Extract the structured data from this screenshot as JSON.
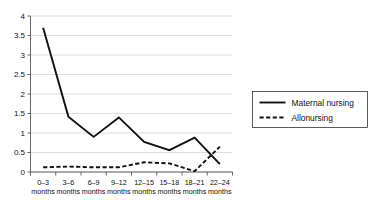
{
  "chart_data": {
    "type": "line",
    "title": "",
    "xlabel": "",
    "ylabel": "",
    "ylim": [
      0,
      4
    ],
    "ytick_values": [
      0,
      0.5,
      1,
      1.5,
      2,
      2.5,
      3,
      3.5,
      4
    ],
    "ytick_labels": [
      "0",
      "0.5",
      "1",
      "1.5",
      "2",
      "2.5",
      "3",
      "3.5",
      "4"
    ],
    "grid": true,
    "legend_position": "right",
    "categories": [
      "0–3 months",
      "3–6 months",
      "6–9 months",
      "9–12 months",
      "12–15 months",
      "15–18 months",
      "18–21 months",
      "22–24 months"
    ],
    "xtick_lines": [
      [
        "0–3",
        "months"
      ],
      [
        "3–6",
        "months"
      ],
      [
        "6–9",
        "months"
      ],
      [
        "9–12",
        "months"
      ],
      [
        "12–15",
        "months"
      ],
      [
        "15–18",
        "months"
      ],
      [
        "18–21",
        "months"
      ],
      [
        "22–24",
        "months"
      ]
    ],
    "series": [
      {
        "name": "Maternal nursing",
        "style": "solid",
        "color": "#111111",
        "values": [
          3.7,
          1.42,
          0.9,
          1.4,
          0.77,
          0.56,
          0.88,
          0.2
        ]
      },
      {
        "name": "Allonursing",
        "style": "dashed",
        "color": "#111111",
        "values": [
          0.12,
          0.14,
          0.12,
          0.12,
          0.25,
          0.22,
          0.02,
          0.65
        ]
      }
    ]
  },
  "legend": {
    "entries": [
      {
        "label": "Maternal nursing",
        "style": "solid"
      },
      {
        "label": "Allonursing",
        "style": "dashed"
      }
    ]
  },
  "colors": {
    "line": "#111111",
    "grid": "#c8c8c8",
    "axis": "#555555",
    "background": "#ffffff"
  }
}
